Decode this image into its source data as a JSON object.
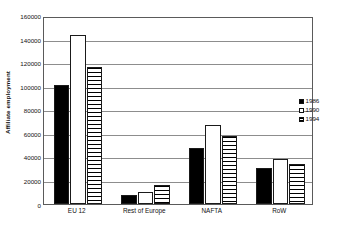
{
  "chart_data": {
    "type": "bar",
    "title": "",
    "subtitle": "",
    "xlabel": "",
    "ylabel": "Affiliate employment",
    "categories": [
      "EU 12",
      "Rest of Europe",
      "NAFTA",
      "RoW"
    ],
    "series": [
      {
        "name": "1986",
        "values": [
          101500,
          7500,
          47500,
          31000
        ]
      },
      {
        "name": "1990",
        "values": [
          143500,
          10500,
          67500,
          38000
        ]
      },
      {
        "name": "1994",
        "values": [
          117000,
          16500,
          58000,
          34000
        ]
      }
    ],
    "ylim": [
      0,
      160000
    ],
    "ytick_labels": [
      "0",
      "20000",
      "40000",
      "60000",
      "80000",
      "100000",
      "120000",
      "140000",
      "160000"
    ],
    "ytick_values": [
      0,
      20000,
      40000,
      60000,
      80000,
      100000,
      120000,
      140000,
      160000
    ],
    "grid": true,
    "legend_position": "right",
    "legend_entries": [
      "1986",
      "1990",
      "1994"
    ],
    "colors": {
      "series_1986": "#000000",
      "series_1990": "#ffffff",
      "series_1994_hatch": "#000000",
      "axis": "#5a5a5a",
      "gridline": "#8d8d8d",
      "background": "#ffffff"
    }
  }
}
